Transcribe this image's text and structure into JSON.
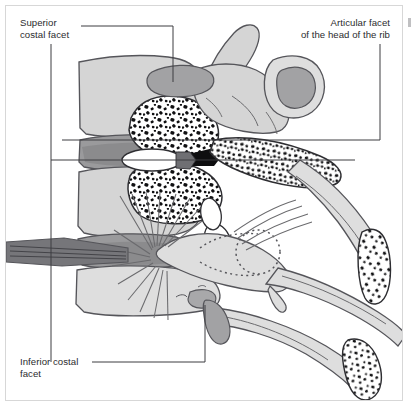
{
  "figure": {
    "view": "Lateral view with partial midsagittal section through the vertebral bodies and ribs",
    "background_color": "#ffffff",
    "frame_color": "#d7d7d7"
  },
  "labels": [
    {
      "id": "superior_costal_facet",
      "text": "Superior\ncostal facet",
      "line1": "Superior",
      "line2": "costal facet",
      "align": "left",
      "position": "top-left"
    },
    {
      "id": "articular_facet_head_rib",
      "text": "Articular facet\nof the head of the rib",
      "line1": "Articular facet",
      "line2": "of the head of the rib",
      "align": "right",
      "position": "top-right"
    },
    {
      "id": "inferior_costal_facet",
      "text": "Inferior costal\nfacet",
      "line1": "Inferior costal",
      "line2": "facet",
      "align": "left",
      "position": "bottom-left"
    }
  ],
  "leader_lines": [
    {
      "id": "leader-superior-facet",
      "from_label": "superior_costal_facet",
      "points": "81,26 173,26 173,82",
      "target": "superior costal facet on vertebral body"
    },
    {
      "id": "leader-superior-vertical",
      "from_label": "superior_costal_facet",
      "points": "51,44 51,160 355,160",
      "target": "sectioned vertebral body / intervertebral disc plane"
    },
    {
      "id": "leader-articular-facet",
      "from_label": "articular_facet_head_rib",
      "points": "380,44 380,140 62,140",
      "target": "articular facet of the head of the rib"
    },
    {
      "id": "leader-inferior-facet",
      "from_label": "inferior_costal_facet",
      "points": "92,362 205,362 205,305",
      "target": "inferior costal facet on vertebral body"
    },
    {
      "id": "leader-inferior-vertical",
      "from_label": "inferior_costal_facet",
      "points": "51,160 51,362",
      "target": "vertical connector down to inferior label"
    }
  ],
  "palette": {
    "bone_fill": "#d5d5d5",
    "bone_fill_light": "#dedede",
    "bone_outline": "#4a4a4d",
    "facet_gray": "#a2a2a4",
    "disc_gray": "#9a9a9c",
    "disc_gray_dark": "#8b8b8d",
    "cortical_white": "#ffffff",
    "trabecula": "#101012",
    "ligament_line": "#6a6a6d",
    "text": "#2b2b2e",
    "leader": "#3d3d40",
    "frame": "#d7d7d7"
  },
  "anatomy": {
    "structures": [
      "vertebral bodies (stacked, lateral profile)",
      "intervertebral discs (two dark gray bands)",
      "sectioned vertebral body showing cancellous bone",
      "superior costal facet",
      "inferior costal facet",
      "transverse process with costal facet",
      "head of the rib with articular facet",
      "neck and shaft of the rib",
      "radiate ligament of the head of the rib (fan of fibers)",
      "costotransverse joint (dotted outline)",
      "cut rib ends showing trabecular bone"
    ],
    "sectioned_regions": [
      "upper vertebral body and rib head — cancellous bone stipple",
      "upper rib shaft cut end",
      "lower rib shaft cut end"
    ]
  }
}
